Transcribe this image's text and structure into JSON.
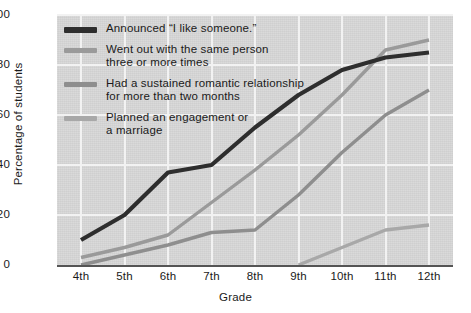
{
  "chart_data": {
    "type": "line",
    "title": "",
    "xlabel": "Grade",
    "ylabel": "Percentage of students",
    "categories": [
      "4th",
      "5th",
      "6th",
      "7th",
      "8th",
      "9th",
      "10th",
      "11th",
      "12th"
    ],
    "ylim": [
      0,
      100
    ],
    "yticks": [
      0,
      20,
      40,
      60,
      80,
      100
    ],
    "grid": true,
    "legend_position": "upper-left-inside",
    "series": [
      {
        "name": "Announced “I like someone.”",
        "color": "#2e2e2e",
        "values": [
          10,
          20,
          37,
          40,
          55,
          68,
          78,
          83,
          85
        ]
      },
      {
        "name": "Went out with the same person\nthree or more times",
        "color": "#9a9a9a",
        "values": [
          3,
          7,
          12,
          25,
          38,
          52,
          68,
          86,
          90
        ]
      },
      {
        "name": "Had a sustained romantic relationship\nfor more than two months",
        "color": "#8e8e8e",
        "values": [
          0,
          4,
          8,
          13,
          14,
          28,
          45,
          60,
          70
        ]
      },
      {
        "name": "Planned an engagement or\na marriage",
        "color": "#a8a8a8",
        "values": [
          null,
          null,
          null,
          null,
          null,
          0,
          7,
          14,
          16
        ]
      }
    ]
  },
  "axes": {
    "ylabel": "Percentage of students",
    "xlabel": "Grade",
    "yticks": [
      "100",
      "80",
      "60",
      "40",
      "20",
      "0"
    ],
    "xticks": [
      "4th",
      "5th",
      "6th",
      "7th",
      "8th",
      "9th",
      "10th",
      "11th",
      "12th"
    ]
  },
  "legend": {
    "items": [
      {
        "label": "Announced “I like someone.”",
        "color": "#2e2e2e"
      },
      {
        "label": "Went out with the same person\nthree or more times",
        "color": "#9a9a9a"
      },
      {
        "label": "Had a sustained romantic relationship\nfor more than two months",
        "color": "#8e8e8e"
      },
      {
        "label": "Planned an engagement or\na marriage",
        "color": "#a8a8a8"
      }
    ]
  },
  "colors": {
    "plot_background": "#d6d6d6",
    "grid": "#f2f2f2",
    "axis": "#555555",
    "text": "#1a1a1a",
    "page_background": "#ffffff"
  }
}
